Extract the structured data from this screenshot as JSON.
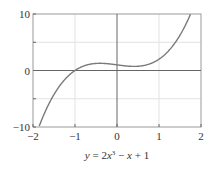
{
  "chart_data": {
    "type": "line",
    "caption": {
      "y": "y",
      "eq": " = 2",
      "x1": "x",
      "exp": "3",
      "rest1": " − ",
      "x2": "x",
      "rest2": " + 1"
    },
    "xlabel": "",
    "ylabel": "",
    "xlim": [
      -2,
      2
    ],
    "ylim": [
      -10,
      10
    ],
    "xticks": [
      -2,
      -1,
      0,
      1,
      2
    ],
    "xtick_labels": [
      "−2",
      "−1",
      "0",
      "1",
      "2"
    ],
    "yticks": [
      -10,
      0,
      10
    ],
    "ytick_labels": [
      "−10",
      "0",
      "10"
    ],
    "grid_y": [
      -5,
      5
    ],
    "grid_x": [
      -1,
      1
    ],
    "grid": true,
    "series": [
      {
        "name": "y = 2x^3 - x + 1",
        "color": "#7a7a7a",
        "function": "2*x^3 - x + 1",
        "x": [
          -1.83,
          -1.5,
          -1.25,
          -1,
          -0.75,
          -0.5,
          -0.41,
          -0.25,
          0,
          0.25,
          0.41,
          0.5,
          0.75,
          1,
          1.25,
          1.5,
          1.75
        ],
        "y": [
          -9.43,
          -4.25,
          -2.66,
          0,
          0.91,
          1.25,
          1.27,
          1.22,
          1,
          0.78,
          0.73,
          0.75,
          1.09,
          2,
          3.66,
          6.25,
          9.97
        ]
      }
    ],
    "colors": {
      "axis": "#666666",
      "grid": "#e2e2e2",
      "frame": "#9a9a9a",
      "curve": "#7a7a7a"
    }
  }
}
